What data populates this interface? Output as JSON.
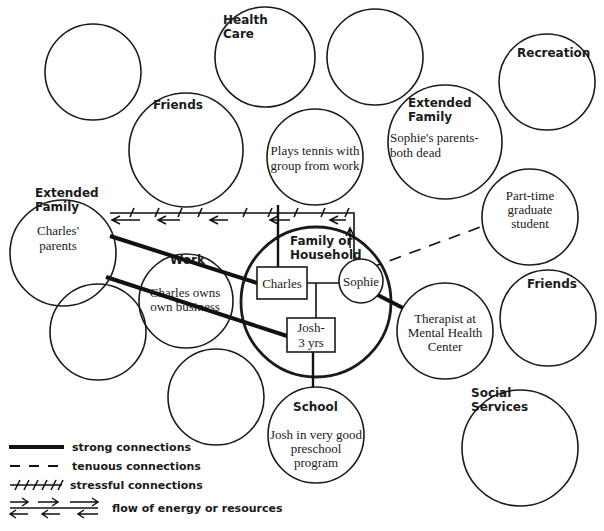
{
  "diagram": {
    "nodes": {
      "top_left_empty": {
        "label": ""
      },
      "health_care": {
        "label_line1": "Health",
        "label_line2": "Care"
      },
      "top_center_empty": {
        "label": ""
      },
      "recreation": {
        "label": "Recreation"
      },
      "friends_left": {
        "label": "Friends"
      },
      "tennis": {
        "note_line1": "Plays tennis with",
        "note_line2": "group from work"
      },
      "extended_family_right": {
        "label_line1": "Extended",
        "label_line2": "Family",
        "note_line1": "Sophie's parents-",
        "note_line2": "both dead"
      },
      "extended_family_left": {
        "label_line1": "Extended",
        "label_line2": "Family",
        "note_line1": "Charles'",
        "note_line2": "parents"
      },
      "part_time_student": {
        "note_line1": "Part-time",
        "note_line2": "graduate",
        "note_line3": "student"
      },
      "work": {
        "label": "Work",
        "note_line1": "Charles owns",
        "note_line2": "own business"
      },
      "family_household": {
        "label_line1": "Family or",
        "label_line2": "Household"
      },
      "charles": {
        "label": "Charles"
      },
      "sophie": {
        "label": "Sophie"
      },
      "josh": {
        "label_line1": "Josh-",
        "label_line2": "3 yrs"
      },
      "friends_right": {
        "label": "Friends"
      },
      "therapist": {
        "note_line1": "Therapist at",
        "note_line2": "Mental Health",
        "note_line3": "Center"
      },
      "mid_left_empty": {
        "label": ""
      },
      "lower_empty": {
        "label": ""
      },
      "school": {
        "label": "School",
        "note_line1": "Josh in very good",
        "note_line2": "preschool",
        "note_line3": "program"
      },
      "social_services": {
        "label_line1": "Social",
        "label_line2": "Services"
      }
    },
    "legend": [
      {
        "type": "strong",
        "label": "strong connections"
      },
      {
        "type": "tenuous",
        "label": "tenuous connections"
      },
      {
        "type": "stressful",
        "label": "stressful connections"
      },
      {
        "type": "flow",
        "label": "flow of energy or resources"
      }
    ],
    "colors": {
      "ink": "#1a1a1a",
      "background": "#ffffff"
    }
  }
}
